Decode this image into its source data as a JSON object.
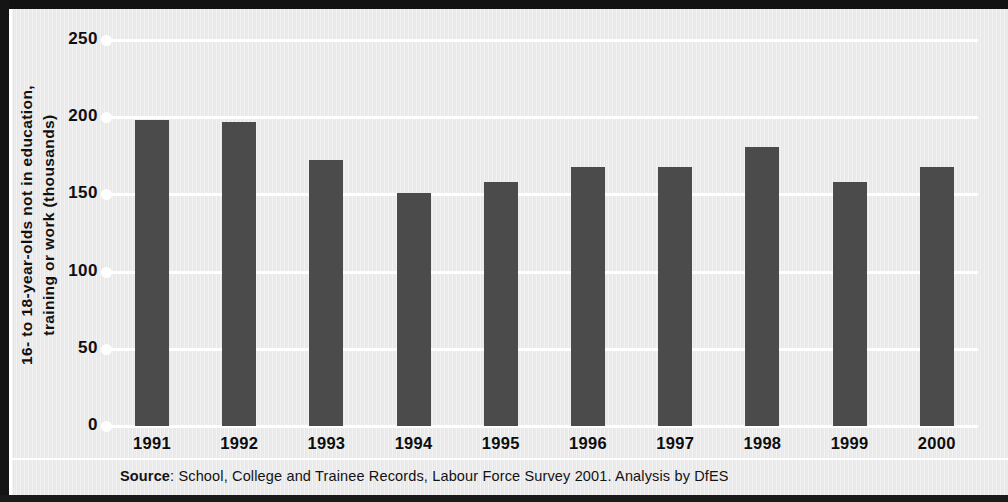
{
  "chart_data": {
    "type": "bar",
    "title": "",
    "subtitle": "",
    "xlabel": "",
    "ylabel_lines": [
      "16- to 18-year-olds not in education,",
      "training or work (thousands)"
    ],
    "ylabel": "16- to 18-year-olds not in education, training or work (thousands)",
    "categories": [
      "1991",
      "1992",
      "1993",
      "1994",
      "1995",
      "1996",
      "1997",
      "1998",
      "1999",
      "2000"
    ],
    "values": [
      198,
      197,
      172,
      151,
      158,
      168,
      168,
      181,
      158,
      168
    ],
    "ylim": [
      0,
      250
    ],
    "ytick_labels": [
      "0",
      "50",
      "100",
      "150",
      "200",
      "250"
    ],
    "ytick_values": [
      0,
      50,
      100,
      150,
      200,
      250
    ],
    "grid": true,
    "grid_color": "#ffffff",
    "legend": null,
    "bar_color": "#4b4b4b",
    "background_color": "#eaeaea"
  },
  "footer": {
    "source_prefix": "Source",
    "source_separator": ": ",
    "source_text": "School, College and Trainee Records, Labour Force Survey 2001. Analysis by DfES"
  }
}
